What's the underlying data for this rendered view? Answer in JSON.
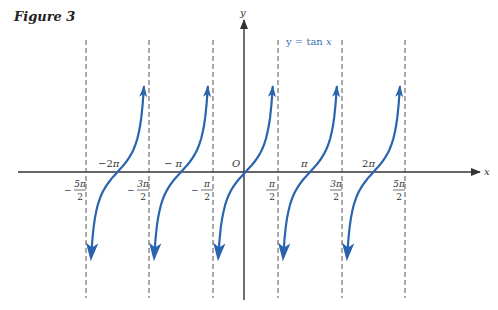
{
  "figure": {
    "title": "Figure 3",
    "equation_label": "y = tan x"
  },
  "axes": {
    "x_label": "x",
    "y_label": "y",
    "origin_label": "O"
  },
  "colors": {
    "curve": "#2a64ae",
    "axis": "#333333",
    "asymptote": "#555555"
  },
  "chart_data": {
    "type": "line",
    "title": "Figure 3",
    "function": "y = tan x",
    "asymptotes": [
      "-5π/2",
      "-3π/2",
      "-π/2",
      "π/2",
      "3π/2",
      "5π/2"
    ],
    "zeros": [
      "-2π",
      "-π",
      "0",
      "π",
      "2π"
    ],
    "x_tick_labels_below": [
      {
        "num": "5π",
        "den": "2",
        "sign": "−"
      },
      {
        "num": "3π",
        "den": "2",
        "sign": "−"
      },
      {
        "num": "π",
        "den": "2",
        "sign": "−"
      },
      {
        "num": "π",
        "den": "2",
        "sign": ""
      },
      {
        "num": "3π",
        "den": "2",
        "sign": ""
      },
      {
        "num": "5π",
        "den": "2",
        "sign": ""
      }
    ],
    "x_tick_labels_above": [
      "−2π",
      "− π",
      "O",
      "π",
      "2π"
    ],
    "xlabel": "x",
    "ylabel": "y",
    "grid": false
  }
}
